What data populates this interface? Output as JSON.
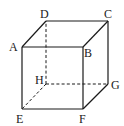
{
  "diagram": {
    "type": "cube",
    "vertices": {
      "A": {
        "label": "A",
        "x": 22,
        "y": 47
      },
      "B": {
        "label": "B",
        "x": 83,
        "y": 47
      },
      "C": {
        "label": "C",
        "x": 108,
        "y": 21
      },
      "D": {
        "label": "D",
        "x": 46,
        "y": 21
      },
      "E": {
        "label": "E",
        "x": 22,
        "y": 109
      },
      "F": {
        "label": "F",
        "x": 83,
        "y": 109
      },
      "G": {
        "label": "G",
        "x": 108,
        "y": 84
      },
      "H": {
        "label": "H",
        "x": 46,
        "y": 84
      }
    },
    "solid_edges": [
      "AB",
      "BF",
      "FE",
      "EA",
      "AD",
      "DC",
      "CB",
      "CG",
      "GF"
    ],
    "dashed_edges": [
      "HD",
      "HE",
      "HG"
    ]
  }
}
